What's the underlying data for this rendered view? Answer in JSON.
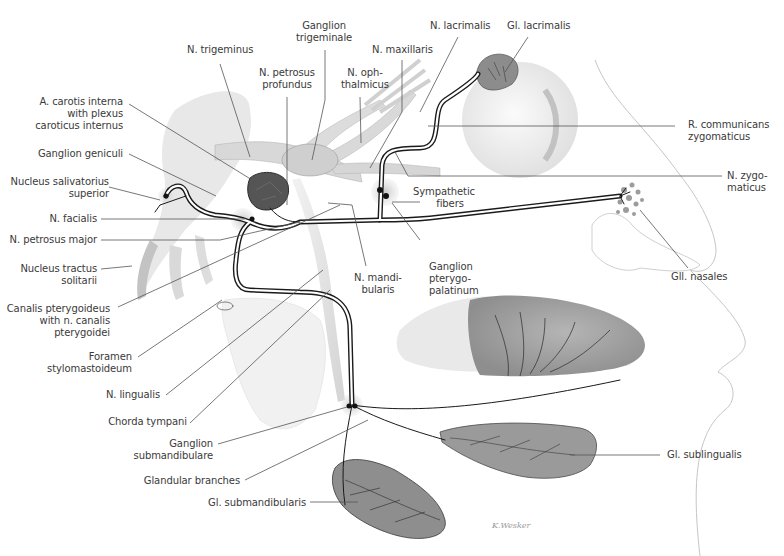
{
  "figure": {
    "colors": {
      "nerve_outline": "#1a1a1a",
      "nerve_fill": "#ffffff",
      "leader_line": "#555555",
      "label_text": "#3a3a3a",
      "tissue_gray": "#bdbdbd",
      "ganglion_halo": "#cfcfcf",
      "artery": "#4a4a4a"
    }
  },
  "labels": {
    "ganglion_trigeminale": [
      "Ganglion",
      "trigeminale"
    ],
    "n_trigeminus": [
      "N. trigeminus"
    ],
    "n_petrosus_profundus": [
      "N. petrosus",
      "profundus"
    ],
    "n_ophthalmicus": [
      "N. oph-",
      "thalmicus"
    ],
    "n_maxillaris": [
      "N. maxillaris"
    ],
    "n_lacrimalis": [
      "N. lacrimalis"
    ],
    "gl_lacrimalis": [
      "Gl. lacrimalis"
    ],
    "a_carotis_interna": [
      "A. carotis interna",
      "with plexus",
      "caroticus internus"
    ],
    "ganglion_geniculi": [
      "Ganglion geniculi"
    ],
    "nucleus_salivatorius": [
      "Nucleus salivatorius",
      "superior"
    ],
    "n_facialis": [
      "N. facialis"
    ],
    "n_petrosus_major": [
      "N. petrosus major"
    ],
    "nucleus_tractus_solitarii": [
      "Nucleus tractus",
      "solitarii"
    ],
    "canalis_pterygoideus": [
      "Canalis pterygoideus",
      "with n. canalis",
      "pterygoidei"
    ],
    "foramen_stylomastoideum": [
      "Foramen",
      "stylomastoideum"
    ],
    "n_lingualis": [
      "N. lingualis"
    ],
    "chorda_tympani": [
      "Chorda tympani"
    ],
    "ganglion_submandibulare": [
      "Ganglion",
      "submandibulare"
    ],
    "glandular_branches": [
      "Glandular  branches"
    ],
    "gl_submandibularis": [
      "Gl. submandibularis"
    ],
    "r_communicans_zygomaticus": [
      "R. communicans",
      "zygomaticus"
    ],
    "n_zygomaticus": [
      "N. zygo-",
      "maticus"
    ],
    "sympathetic_fibers": [
      "Sympathetic",
      "fibers"
    ],
    "n_mandibularis": [
      "N. mandi-",
      "bularis"
    ],
    "ganglion_pterygopalatinum": [
      "Ganglion",
      "pterygo-",
      "palatinum"
    ],
    "gll_nasales": [
      "Gll. nasales"
    ],
    "gl_sublingualis": [
      "Gl. sublingualis"
    ]
  },
  "signature": "K.Wesker"
}
